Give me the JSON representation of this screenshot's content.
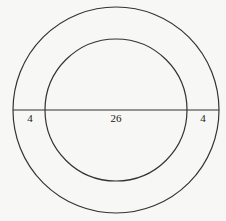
{
  "diagram": {
    "outer_circle": {
      "cx": 116,
      "cy": 110,
      "r": 103
    },
    "inner_circle": {
      "cx": 116,
      "cy": 110,
      "r": 71
    },
    "diameter_line": {
      "x1": 13,
      "y1": 110,
      "x2": 219,
      "y2": 110
    },
    "labels": [
      {
        "text": "4",
        "x": 30,
        "y": 122,
        "meaning": "left ring width"
      },
      {
        "text": "26",
        "x": 116,
        "y": 122,
        "meaning": "inner circle diameter"
      },
      {
        "text": "4",
        "x": 203,
        "y": 122,
        "meaning": "right ring width"
      }
    ],
    "stroke_color": "#333333",
    "background": "#f7f7f5"
  }
}
